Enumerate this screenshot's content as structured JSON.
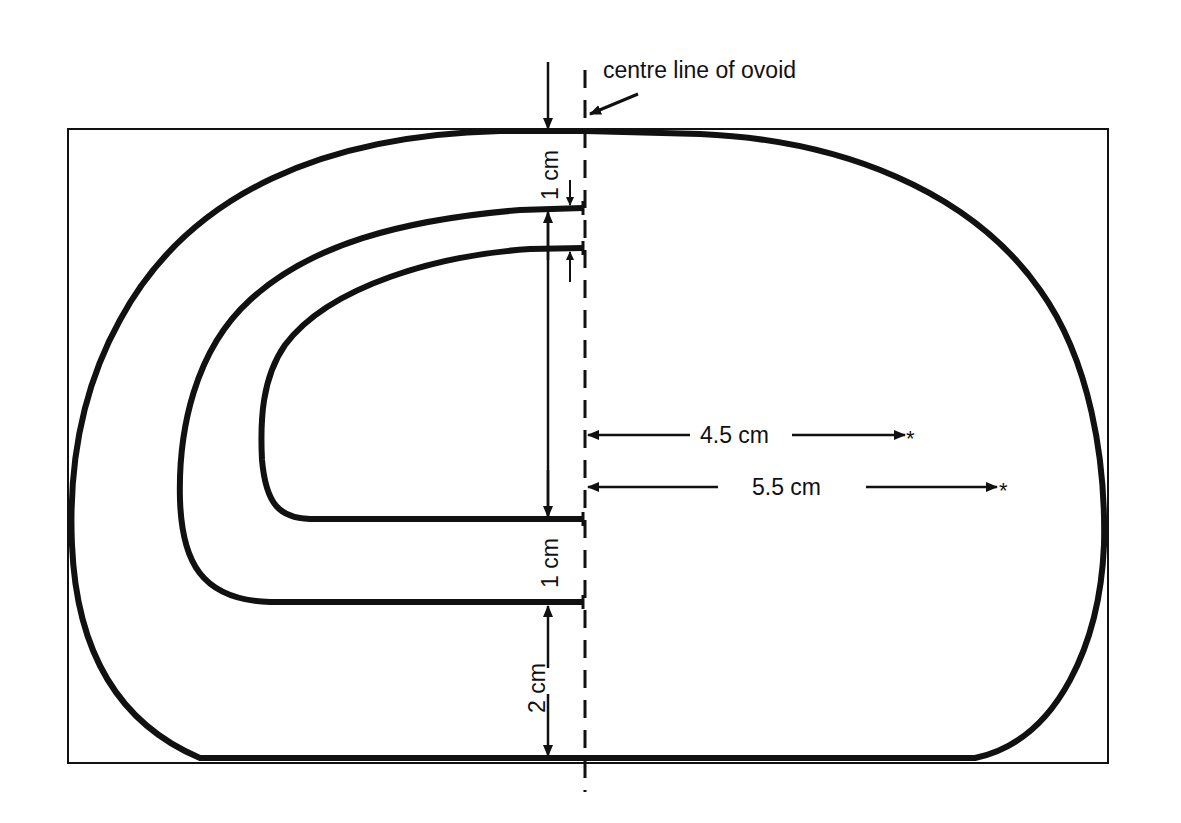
{
  "diagram": {
    "title_annotation": "centre line of ovoid",
    "colors": {
      "ink": "#111111",
      "background": "#ffffff"
    },
    "labels": {
      "top_gap": "1 cm",
      "middle_gap": "1 cm",
      "bottom_gap": "2 cm",
      "inner_radius": "4.5 cm",
      "outer_radius": "5.5 cm"
    },
    "markers": {
      "radius_end": "*"
    },
    "shapes": [
      {
        "id": "bounding-box",
        "description": "thin rectangle enclosing ovoid"
      },
      {
        "id": "outer-ovoid",
        "description": "outer thick closed contour"
      },
      {
        "id": "middle-contour",
        "description": "half-contour opening at centre line"
      },
      {
        "id": "inner-contour",
        "description": "innermost half-contour opening at centre line"
      },
      {
        "id": "centre-line",
        "description": "dashed vertical centre line"
      }
    ]
  }
}
